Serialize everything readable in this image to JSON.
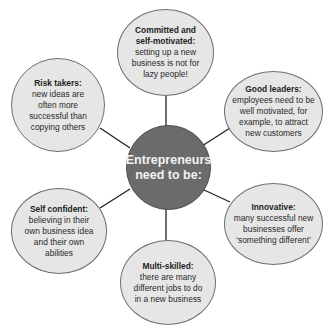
{
  "diagram": {
    "type": "spider-diagram",
    "center": {
      "label": "Entrepreneurs need to be:",
      "line1": "Entrepreneurs",
      "line2": "need to be:"
    },
    "nodes": [
      {
        "id": "committed",
        "title": "Committed and self-motivated:",
        "title_l1": "Committed and",
        "title_l2": "self-motivated:",
        "body": "setting up a new business is not for lazy people!"
      },
      {
        "id": "risk",
        "title": "Risk takers:",
        "body": "new ideas are often more successful than copying others"
      },
      {
        "id": "leaders",
        "title": "Good leaders:",
        "body": "employees need to be well motivated, for example, to attract new customers"
      },
      {
        "id": "self",
        "title": "Self confident:",
        "body": "believing in their own business idea and their own abilities"
      },
      {
        "id": "innovative",
        "title": "Innovative:",
        "body": "many successful new businesses offer ‘something different’"
      },
      {
        "id": "multi",
        "title": "Multi-skilled:",
        "body": "there are many different jobs to do in a new business"
      }
    ],
    "colors": {
      "center_fill": "#6b6b6b",
      "node_fill": "#e6e6e6",
      "line": "#222222"
    }
  }
}
